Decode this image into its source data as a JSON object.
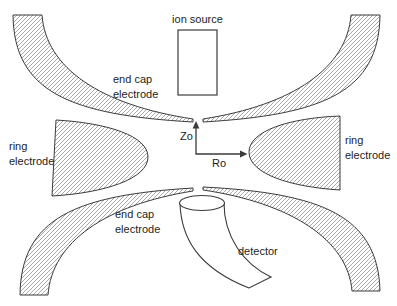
{
  "diagram": {
    "ion_source_label": "ion source",
    "end_cap_top": {
      "line1": "end cap",
      "line2": "electrode"
    },
    "end_cap_bottom": {
      "line1": "end cap",
      "line2": "electrode"
    },
    "ring_left": {
      "line1": "ring",
      "line2": "electrode"
    },
    "ring_right": {
      "line1": "ring",
      "line2": "electrode"
    },
    "axes": {
      "z_label": "Zo",
      "r_label": "Ro"
    },
    "detector_label": "detector",
    "colors": {
      "background": "#ffffff",
      "outline": "#3b3b3b",
      "hatch": "#8e8e8e",
      "text": "#1d1d1d"
    }
  }
}
